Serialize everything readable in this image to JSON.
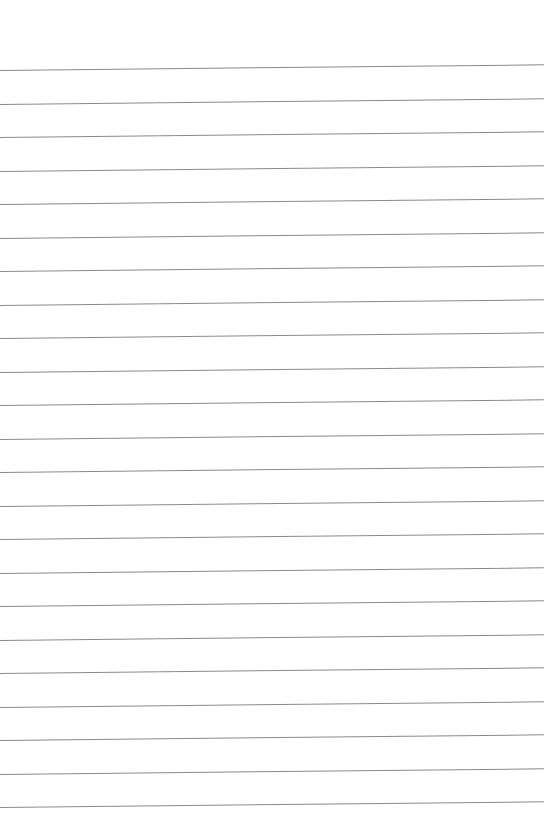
{
  "page": {
    "type": "lined-paper",
    "background_color": "#ffffff",
    "line_color": "#8a8a8a",
    "line_count": 23,
    "first_line_y": 70,
    "line_spacing": 33.5,
    "line_slope_deg": -0.6
  }
}
